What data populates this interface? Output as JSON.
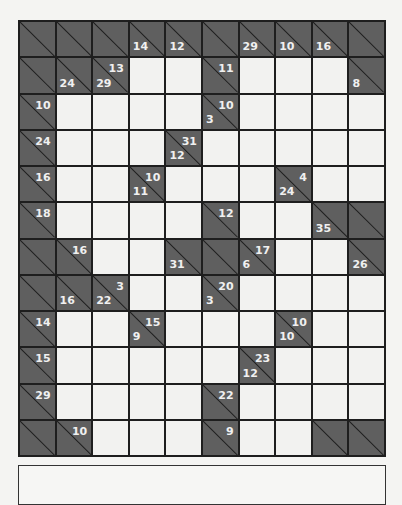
{
  "puzzle": {
    "type": "kakuro",
    "rows": 12,
    "cols": 10,
    "colors": {
      "block": "#5f5f5f",
      "line": "#1e1e1e",
      "cell": "#f2f2f0",
      "clue_text": "#f0f0f0"
    },
    "grid": [
      [
        {
          "t": "b"
        },
        {
          "t": "b"
        },
        {
          "t": "b"
        },
        {
          "t": "b",
          "d": 14
        },
        {
          "t": "b",
          "d": 12
        },
        {
          "t": "b"
        },
        {
          "t": "b",
          "d": 29
        },
        {
          "t": "b",
          "d": 10
        },
        {
          "t": "b",
          "d": 16
        },
        {
          "t": "b"
        }
      ],
      [
        {
          "t": "b"
        },
        {
          "t": "b",
          "d": 24
        },
        {
          "t": "b",
          "r": 13,
          "d": 29
        },
        {
          "t": "w"
        },
        {
          "t": "w"
        },
        {
          "t": "b",
          "r": 11
        },
        {
          "t": "w"
        },
        {
          "t": "w"
        },
        {
          "t": "w"
        },
        {
          "t": "b",
          "d": 8
        }
      ],
      [
        {
          "t": "b",
          "r": 10
        },
        {
          "t": "w"
        },
        {
          "t": "w"
        },
        {
          "t": "w"
        },
        {
          "t": "w"
        },
        {
          "t": "b",
          "r": 10,
          "d": 3
        },
        {
          "t": "w"
        },
        {
          "t": "w"
        },
        {
          "t": "w"
        },
        {
          "t": "w"
        }
      ],
      [
        {
          "t": "b",
          "r": 24
        },
        {
          "t": "w"
        },
        {
          "t": "w"
        },
        {
          "t": "w"
        },
        {
          "t": "b",
          "r": 31,
          "d": 12
        },
        {
          "t": "w"
        },
        {
          "t": "w"
        },
        {
          "t": "w"
        },
        {
          "t": "w"
        },
        {
          "t": "w"
        }
      ],
      [
        {
          "t": "b",
          "r": 16
        },
        {
          "t": "w"
        },
        {
          "t": "w"
        },
        {
          "t": "b",
          "r": 10,
          "d": 11
        },
        {
          "t": "w"
        },
        {
          "t": "w"
        },
        {
          "t": "w"
        },
        {
          "t": "b",
          "r": 4,
          "d": 24
        },
        {
          "t": "w"
        },
        {
          "t": "w"
        }
      ],
      [
        {
          "t": "b",
          "r": 18
        },
        {
          "t": "w"
        },
        {
          "t": "w"
        },
        {
          "t": "w"
        },
        {
          "t": "w"
        },
        {
          "t": "b",
          "r": 12
        },
        {
          "t": "w"
        },
        {
          "t": "w"
        },
        {
          "t": "b",
          "d": 35
        },
        {
          "t": "b"
        }
      ],
      [
        {
          "t": "b"
        },
        {
          "t": "b",
          "r": 16
        },
        {
          "t": "w"
        },
        {
          "t": "w"
        },
        {
          "t": "b",
          "d": 31
        },
        {
          "t": "b"
        },
        {
          "t": "b",
          "r": 17,
          "d": 6
        },
        {
          "t": "w"
        },
        {
          "t": "w"
        },
        {
          "t": "b",
          "d": 26
        }
      ],
      [
        {
          "t": "b"
        },
        {
          "t": "b",
          "d": 16
        },
        {
          "t": "b",
          "r": 3,
          "d": 22
        },
        {
          "t": "w"
        },
        {
          "t": "w"
        },
        {
          "t": "b",
          "r": 20,
          "d": 3
        },
        {
          "t": "w"
        },
        {
          "t": "w"
        },
        {
          "t": "w"
        },
        {
          "t": "w"
        }
      ],
      [
        {
          "t": "b",
          "r": 14
        },
        {
          "t": "w"
        },
        {
          "t": "w"
        },
        {
          "t": "b",
          "r": 15,
          "d": 9
        },
        {
          "t": "w"
        },
        {
          "t": "w"
        },
        {
          "t": "w"
        },
        {
          "t": "b",
          "r": 10,
          "d": 10
        },
        {
          "t": "w"
        },
        {
          "t": "w"
        }
      ],
      [
        {
          "t": "b",
          "r": 15
        },
        {
          "t": "w"
        },
        {
          "t": "w"
        },
        {
          "t": "w"
        },
        {
          "t": "w"
        },
        {
          "t": "w"
        },
        {
          "t": "b",
          "r": 23,
          "d": 12
        },
        {
          "t": "w"
        },
        {
          "t": "w"
        },
        {
          "t": "w"
        }
      ],
      [
        {
          "t": "b",
          "r": 29
        },
        {
          "t": "w"
        },
        {
          "t": "w"
        },
        {
          "t": "w"
        },
        {
          "t": "w"
        },
        {
          "t": "b",
          "r": 22
        },
        {
          "t": "w"
        },
        {
          "t": "w"
        },
        {
          "t": "w"
        },
        {
          "t": "w"
        }
      ],
      [
        {
          "t": "b"
        },
        {
          "t": "b",
          "r": 10
        },
        {
          "t": "w"
        },
        {
          "t": "w"
        },
        {
          "t": "w"
        },
        {
          "t": "b",
          "r": 9
        },
        {
          "t": "w"
        },
        {
          "t": "w"
        },
        {
          "t": "b"
        },
        {
          "t": "b"
        }
      ]
    ]
  }
}
